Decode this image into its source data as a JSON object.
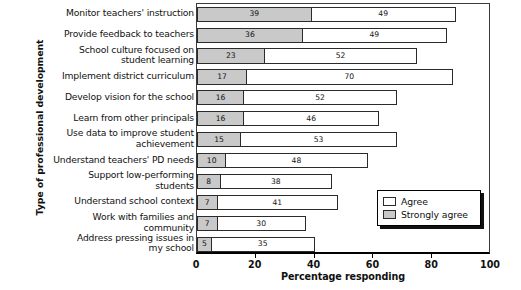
{
  "chart_data": {
    "type": "bar",
    "orientation": "horizontal",
    "stacked": true,
    "title": "",
    "xlabel": "Percentage responding",
    "ylabel": "Type of professional development",
    "xlim": [
      0,
      100
    ],
    "xticks": [
      0,
      20,
      40,
      60,
      80,
      100
    ],
    "grid": false,
    "legend_position": "inside-bottom-right",
    "categories": [
      "Monitor teachers' instruction",
      "Provide feedback to teachers",
      "School culture focused on student learning",
      "Implement district curriculum",
      "Develop vision for the school",
      "Learn from other principals",
      "Use data to improve student achievement",
      "Understand teachers' PD needs",
      "Support low-performing students",
      "Understand school context",
      "Work with families and community",
      "Address pressing issues in my school"
    ],
    "category_lines": [
      [
        "Monitor teachers' instruction"
      ],
      [
        "Provide feedback to teachers"
      ],
      [
        "School culture focused on",
        "student learning"
      ],
      [
        "Implement district curriculum"
      ],
      [
        "Develop vision for the school"
      ],
      [
        "Learn from other principals"
      ],
      [
        "Use data to improve student",
        "achievement"
      ],
      [
        "Understand teachers' PD needs"
      ],
      [
        "Support low-performing",
        "students"
      ],
      [
        "Understand school context"
      ],
      [
        "Work with families and",
        "community"
      ],
      [
        "Address pressing issues in",
        "my school"
      ]
    ],
    "series": [
      {
        "name": "Strongly agree",
        "color": "#c9c9c9",
        "values": [
          39,
          36,
          23,
          17,
          16,
          16,
          15,
          10,
          8,
          7,
          7,
          5
        ]
      },
      {
        "name": "Agree",
        "color": "#ffffff",
        "values": [
          49,
          49,
          52,
          70,
          52,
          46,
          53,
          48,
          38,
          41,
          30,
          35
        ]
      }
    ],
    "totals": [
      88,
      85,
      75,
      87,
      68,
      62,
      68,
      58,
      46,
      48,
      37,
      40
    ]
  },
  "legend": {
    "items": [
      {
        "label": "Agree",
        "swatch": "agree"
      },
      {
        "label": "Strongly agree",
        "swatch": "strong"
      }
    ]
  },
  "axis": {
    "x_title": "Percentage responding",
    "y_title": "Type of professional development",
    "x_tick_labels": [
      "0",
      "20",
      "40",
      "60",
      "80",
      "100"
    ]
  }
}
